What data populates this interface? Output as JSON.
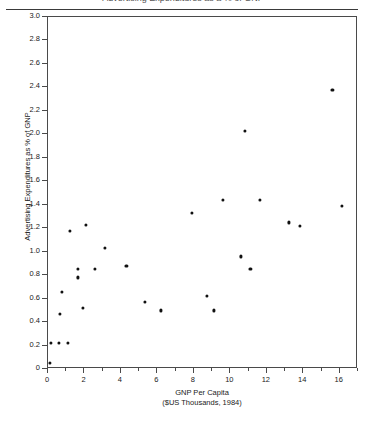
{
  "figure": {
    "clipped_header_text": "Advertising Expenditures as a % of GNP",
    "ylabel": "Advertising Expenditures as % of GNP",
    "xlabel_line1": "GNP Per Capita",
    "xlabel_line2": "($US Thousands, 1984)",
    "marker_color": "#111111",
    "frame_color": "#4a4a4a",
    "background": "#ffffff"
  },
  "chart_data": {
    "type": "scatter",
    "title": "",
    "xlabel": "GNP Per Capita ($US Thousands, 1984)",
    "ylabel": "Advertising Expenditures as % of GNP",
    "xlim": [
      0,
      17
    ],
    "ylim": [
      0,
      3.0
    ],
    "xticks": [
      0,
      2,
      4,
      6,
      8,
      10,
      12,
      14,
      16
    ],
    "xtick_labels": [
      "0",
      "2",
      "4",
      "6",
      "8",
      "10",
      "12",
      "14",
      "16"
    ],
    "xminor_step": 1,
    "yticks": [
      0,
      0.2,
      0.4,
      0.6,
      0.8,
      1.0,
      1.2,
      1.4,
      1.6,
      1.8,
      2.0,
      2.2,
      2.4,
      2.6,
      2.8,
      3.0
    ],
    "ytick_labels": [
      "0",
      "0.2",
      "0.4",
      "0.6",
      "0.8",
      "1.0",
      "1.2",
      "1.4",
      "1.6",
      "1.8",
      "2.0",
      "2.2",
      "2.4",
      "2.6",
      "2.8",
      "3.0"
    ],
    "grid": false,
    "legend": null,
    "points": [
      {
        "x": 0.1,
        "y": 0.05
      },
      {
        "x": 0.15,
        "y": 0.22
      },
      {
        "x": 0.6,
        "y": 0.22
      },
      {
        "x": 1.1,
        "y": 0.22
      },
      {
        "x": 0.75,
        "y": 0.66
      },
      {
        "x": 0.65,
        "y": 0.47
      },
      {
        "x": 1.2,
        "y": 1.18
      },
      {
        "x": 1.65,
        "y": 0.85
      },
      {
        "x": 1.65,
        "y": 0.78
      },
      {
        "x": 2.1,
        "y": 1.23
      },
      {
        "x": 1.9,
        "y": 0.52
      },
      {
        "x": 2.55,
        "y": 0.85
      },
      {
        "x": 3.1,
        "y": 1.03
      },
      {
        "x": 4.3,
        "y": 0.88
      },
      {
        "x": 5.3,
        "y": 0.57
      },
      {
        "x": 6.2,
        "y": 0.5
      },
      {
        "x": 7.9,
        "y": 1.33
      },
      {
        "x": 8.7,
        "y": 0.62
      },
      {
        "x": 9.1,
        "y": 0.5
      },
      {
        "x": 9.6,
        "y": 1.44
      },
      {
        "x": 10.8,
        "y": 2.03
      },
      {
        "x": 10.6,
        "y": 0.96
      },
      {
        "x": 11.1,
        "y": 0.85
      },
      {
        "x": 11.6,
        "y": 1.44
      },
      {
        "x": 13.2,
        "y": 1.25
      },
      {
        "x": 13.8,
        "y": 1.22
      },
      {
        "x": 15.6,
        "y": 2.38
      },
      {
        "x": 16.1,
        "y": 1.39
      }
    ]
  }
}
